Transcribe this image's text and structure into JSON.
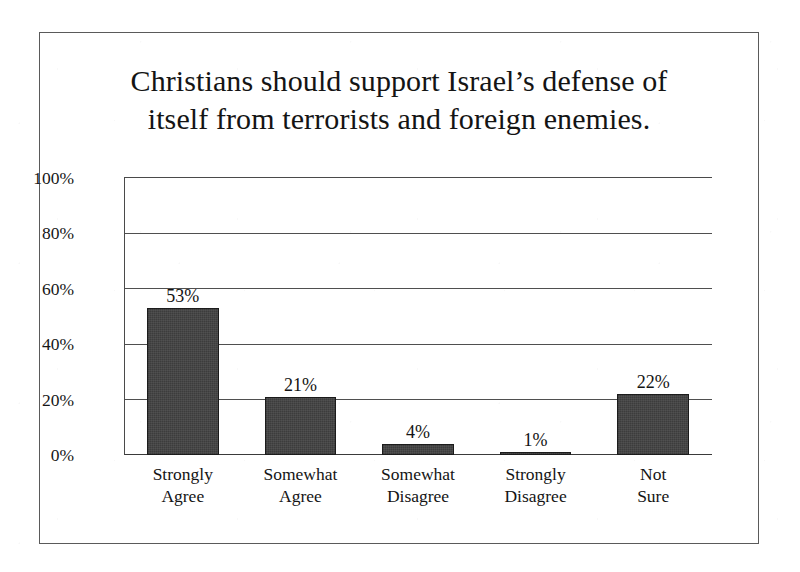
{
  "chart_data": {
    "type": "bar",
    "title_lines": [
      "Christians should support Israel’s defense of",
      "itself from terrorists and foreign enemies."
    ],
    "categories": [
      "Strongly Agree",
      "Somewhat Agree",
      "Somewhat Disagree",
      "Strongly Disagree",
      "Not Sure"
    ],
    "category_lines": [
      [
        "Strongly",
        "Agree"
      ],
      [
        "Somewhat",
        "Agree"
      ],
      [
        "Somewhat",
        "Disagree"
      ],
      [
        "Strongly",
        "Disagree"
      ],
      [
        "Not",
        "Sure"
      ]
    ],
    "values": [
      53,
      21,
      4,
      1,
      22
    ],
    "value_labels": [
      "53%",
      "21%",
      "4%",
      "1%",
      "22%"
    ],
    "xlabel": "",
    "ylabel": "",
    "ylim": [
      0,
      100
    ],
    "ytick_values": [
      0,
      20,
      40,
      60,
      80,
      100
    ],
    "ytick_labels": [
      "0%",
      "20%",
      "40%",
      "60%",
      "80%",
      "100%"
    ],
    "grid": true,
    "grid_axis": "y",
    "legend": false,
    "legend_position": "none",
    "bar_color": "#3c3c3c",
    "axis_color": "#4a4a4a",
    "background_color": "#ffffff",
    "frame_color": "#5a5a5a"
  }
}
